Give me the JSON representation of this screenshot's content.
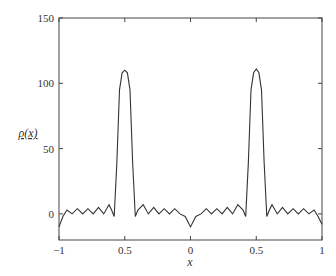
{
  "chart_data": {
    "type": "line",
    "title": "",
    "xlabel": "x",
    "ylabel": "ρ(x)",
    "xlim": [
      -1,
      1
    ],
    "ylim": [
      -20,
      150
    ],
    "xticks": [
      -1,
      -0.5,
      0,
      0.5,
      1
    ],
    "xtick_labels": [
      "−1",
      "0.5",
      "0",
      "0.5",
      "1"
    ],
    "yticks": [
      0,
      50,
      100,
      150
    ],
    "ytick_labels": [
      "0",
      "50",
      "100",
      "150"
    ],
    "grid": false,
    "legend": null,
    "series": [
      {
        "name": "rho(x)",
        "color": "#333333",
        "x": [
          -1.0,
          -0.97,
          -0.94,
          -0.9,
          -0.86,
          -0.82,
          -0.78,
          -0.74,
          -0.7,
          -0.66,
          -0.62,
          -0.6,
          -0.58,
          -0.56,
          -0.54,
          -0.52,
          -0.5,
          -0.48,
          -0.46,
          -0.44,
          -0.42,
          -0.4,
          -0.36,
          -0.32,
          -0.28,
          -0.24,
          -0.2,
          -0.16,
          -0.12,
          -0.08,
          -0.04,
          0.0,
          0.04,
          0.08,
          0.12,
          0.16,
          0.2,
          0.24,
          0.28,
          0.32,
          0.36,
          0.4,
          0.42,
          0.44,
          0.46,
          0.48,
          0.5,
          0.52,
          0.54,
          0.56,
          0.58,
          0.6,
          0.62,
          0.66,
          0.7,
          0.74,
          0.78,
          0.82,
          0.86,
          0.9,
          0.94,
          0.97,
          1.0
        ],
        "y": [
          -10,
          -2,
          3,
          0,
          4,
          0,
          4,
          0,
          5,
          0,
          7,
          3,
          -2,
          40,
          95,
          108,
          110,
          108,
          95,
          40,
          -2,
          3,
          7,
          0,
          5,
          0,
          4,
          0,
          4,
          0,
          -2,
          -10,
          -2,
          0,
          4,
          0,
          4,
          0,
          5,
          0,
          7,
          3,
          -2,
          40,
          95,
          108,
          111,
          108,
          95,
          40,
          -2,
          3,
          7,
          0,
          5,
          0,
          4,
          0,
          4,
          0,
          3,
          -2,
          -8
        ]
      }
    ]
  }
}
